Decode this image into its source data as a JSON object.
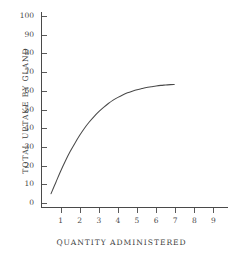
{
  "chart_data": {
    "type": "line",
    "title": "",
    "subtitle": "",
    "xlabel": "QUANTITY  ADMINISTERED",
    "ylabel": "TOTAL UPTAKE BY GLAND",
    "xlim": [
      0,
      9.6
    ],
    "ylim": [
      0,
      105
    ],
    "grid": false,
    "legend": null,
    "legend_position": "none",
    "x_ticks": [
      1,
      2,
      3,
      4,
      5,
      6,
      7,
      8,
      9
    ],
    "x_tick_labels": [
      "1",
      "2",
      "3",
      "4",
      "5",
      "6",
      "7",
      "8",
      "9"
    ],
    "y_ticks": [
      0,
      10,
      20,
      30,
      40,
      50,
      60,
      70,
      80,
      90,
      100
    ],
    "y_tick_labels": [
      "0",
      "10",
      "20",
      "30",
      "40",
      "50",
      "60",
      "70",
      "80",
      "90",
      "100"
    ],
    "tick_direction": "in",
    "series": [
      {
        "name": "uptake",
        "x": [
          0.5,
          0.75,
          1.0,
          1.25,
          1.5,
          1.75,
          2.0,
          2.25,
          2.5,
          2.75,
          3.0,
          3.25,
          3.5,
          3.75,
          4.0,
          4.25,
          4.5,
          4.75,
          5.0,
          5.25,
          5.5,
          5.75,
          6.0,
          6.25,
          6.5,
          6.75,
          6.95
        ],
        "y": [
          5.0,
          11.0,
          17.0,
          22.5,
          27.5,
          32.0,
          36.2,
          40.0,
          43.3,
          46.2,
          48.8,
          51.1,
          53.2,
          55.0,
          56.5,
          57.8,
          58.9,
          59.8,
          60.6,
          61.2,
          61.8,
          62.2,
          62.6,
          62.9,
          63.1,
          63.3,
          63.4
        ]
      }
    ],
    "annotations": [],
    "colors": {
      "curve": "#4a4a4a",
      "axis": "#4a4a4a",
      "text": "#3f3f3f",
      "background": "#ffffff"
    }
  },
  "axes": {
    "x_title": "QUANTITY  ADMINISTERED",
    "y_title": "TOTAL UPTAKE BY GLAND"
  }
}
